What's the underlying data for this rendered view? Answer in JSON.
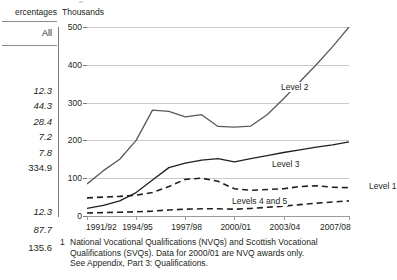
{
  "left_column": {
    "header_units": "ercentages",
    "header_col": "All",
    "values": [
      {
        "text": "12.3",
        "italic": true,
        "top": 85
      },
      {
        "text": "44.3",
        "italic": true,
        "top": 100
      },
      {
        "text": "28.4",
        "italic": true,
        "top": 116
      },
      {
        "text": "7.2",
        "italic": true,
        "top": 131
      },
      {
        "text": "7.8",
        "italic": true,
        "top": 147
      },
      {
        "text": "334.9",
        "italic": false,
        "top": 162
      },
      {
        "text": "12.3",
        "italic": true,
        "top": 206
      },
      {
        "text": "87.7",
        "italic": true,
        "top": 224
      },
      {
        "text": "135.6",
        "italic": false,
        "top": 242
      }
    ]
  },
  "chart_data": {
    "type": "line",
    "title": "",
    "units_label": "Thousands",
    "xlabel": "",
    "ylabel": "Thousands",
    "ylim": [
      0,
      500
    ],
    "yticks": [
      0,
      100,
      200,
      300,
      400,
      500
    ],
    "ytick_labels": [
      "0",
      "100",
      "200",
      "300",
      "400",
      "500"
    ],
    "grid": true,
    "legend_position": "inline-labels",
    "x": [
      "1991/92",
      "1992/93",
      "1993/94",
      "1994/95",
      "1995/96",
      "1996/97",
      "1997/98",
      "1998/99",
      "1999/00",
      "2000/01",
      "2001/02",
      "2002/03",
      "2003/04",
      "2004/05",
      "2005/06",
      "2006/07",
      "2007/08"
    ],
    "xtick_labels": [
      "1991/92",
      "1994/95",
      "1997/98",
      "2000/01",
      "2003/04",
      "2007/08"
    ],
    "xtick_indices": [
      0,
      3,
      6,
      9,
      12,
      16
    ],
    "series": [
      {
        "name": "Level 2",
        "style": "solid",
        "color": "#595959",
        "values": [
          85,
          120,
          150,
          200,
          280,
          277,
          262,
          268,
          237,
          235,
          238,
          268,
          310,
          355,
          400,
          448,
          500
        ]
      },
      {
        "name": "Level 3",
        "style": "solid",
        "color": "#231f20",
        "values": [
          20,
          28,
          40,
          62,
          95,
          128,
          140,
          148,
          152,
          143,
          152,
          160,
          168,
          175,
          182,
          188,
          196
        ]
      },
      {
        "name": "Level 1",
        "style": "dashed",
        "color": "#231f20",
        "values": [
          48,
          50,
          52,
          55,
          62,
          78,
          97,
          100,
          92,
          72,
          68,
          70,
          72,
          78,
          80,
          76,
          75
        ]
      },
      {
        "name": "Levels 4 and 5",
        "style": "dashed",
        "color": "#231f20",
        "values": [
          8,
          9,
          10,
          11,
          13,
          16,
          18,
          19,
          19,
          18,
          20,
          23,
          26,
          30,
          34,
          37,
          40
        ]
      }
    ]
  },
  "footnote": {
    "marker": "1",
    "lines": [
      "National Vocational Qualifications (NVQs) and Scottish Vocational",
      "Qualifications (SVQs). Data for 2000/01 are NVQ awards only.",
      "See Appendix, Part 3: Qualifications."
    ]
  }
}
